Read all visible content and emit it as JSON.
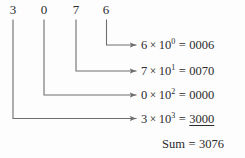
{
  "figure": {
    "number": "3076",
    "digits": [
      {
        "value": "3"
      },
      {
        "value": "0"
      },
      {
        "value": "7"
      },
      {
        "value": "6"
      }
    ],
    "rows": [
      {
        "coefficient": "6",
        "times": "×",
        "base": "10",
        "exponent": "0",
        "equals": "=",
        "value": "0006",
        "underlined": false
      },
      {
        "coefficient": "7",
        "times": "×",
        "base": "10",
        "exponent": "1",
        "equals": "=",
        "value": "0070",
        "underlined": false
      },
      {
        "coefficient": "0",
        "times": "×",
        "base": "10",
        "exponent": "2",
        "equals": "=",
        "value": "0000",
        "underlined": false
      },
      {
        "coefficient": "3",
        "times": "×",
        "base": "10",
        "exponent": "3",
        "equals": "=",
        "value": "3000",
        "underlined": true
      }
    ],
    "sum": {
      "label": "Sum",
      "equals": "=",
      "value": "3076"
    },
    "colors": {
      "background": "#fdfdfd",
      "text": "#2b2b2b",
      "connector": "#6e6e6e"
    }
  }
}
